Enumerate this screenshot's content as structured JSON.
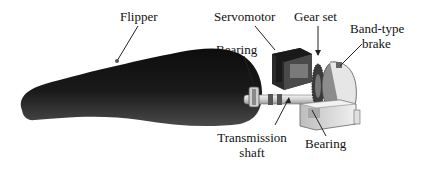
{
  "diagram": {
    "title": "",
    "labels": {
      "flipper": "Flipper",
      "servomotor": "Servomotor",
      "gear_set": "Gear set",
      "band_brake_line1": "Band-type",
      "band_brake_line2": "brake",
      "bearing_top": "Bearing",
      "transmission_line1": "Transmission",
      "transmission_line2": "shaft",
      "bearing_bottom": "Bearing"
    },
    "components": [
      {
        "id": "flipper",
        "label": "Flipper"
      },
      {
        "id": "servomotor",
        "label": "Servomotor"
      },
      {
        "id": "gear-set",
        "label": "Gear set"
      },
      {
        "id": "band-type-brake",
        "label": "Band-type brake"
      },
      {
        "id": "bearing-1",
        "label": "Bearing"
      },
      {
        "id": "transmission-shaft",
        "label": "Transmission shaft"
      },
      {
        "id": "bearing-2",
        "label": "Bearing"
      }
    ],
    "colors": {
      "flipper_dark": "#111111",
      "flipper_mid": "#3a3a3a",
      "motor_dark": "#2a2a2a",
      "housing_light": "#e4e4e4",
      "line": "#222222"
    }
  }
}
